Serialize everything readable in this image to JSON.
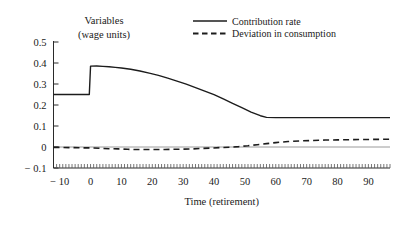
{
  "chart_data": {
    "type": "line",
    "title": "",
    "xlabel": "Time (retirement)",
    "ylabel": "Variables",
    "ylabel_line2": "(wage units)",
    "xlim": [
      -12,
      97
    ],
    "ylim": [
      -0.1,
      0.5
    ],
    "grid": false,
    "legend_position": "top-right",
    "xticks": [
      -10,
      0,
      10,
      20,
      30,
      40,
      50,
      60,
      70,
      80,
      90
    ],
    "xtick_labels": [
      "− 10",
      "0",
      "10",
      "20",
      "30",
      "40",
      "50",
      "60",
      "70",
      "80",
      "90"
    ],
    "yticks": [
      -0.1,
      0,
      0.1,
      0.2,
      0.3,
      0.4,
      0.5
    ],
    "ytick_labels": [
      "− 0.1",
      "0",
      "0.1",
      "0.2",
      "0.3",
      "0.4",
      "0.5"
    ],
    "zero_reference_line": 0,
    "series": [
      {
        "name": "Contribution rate",
        "style": "solid",
        "color": "#1c1c1c",
        "x": [
          -12,
          -10,
          -5,
          -0.4,
          0,
          2,
          4,
          6,
          8,
          10,
          13,
          16,
          19,
          22,
          25,
          28,
          31,
          34,
          37,
          40,
          43,
          46,
          49,
          52,
          55,
          57,
          60,
          65,
          70,
          75,
          80,
          85,
          90,
          97
        ],
        "values": [
          0.25,
          0.25,
          0.25,
          0.25,
          0.385,
          0.386,
          0.384,
          0.382,
          0.379,
          0.376,
          0.37,
          0.362,
          0.352,
          0.341,
          0.328,
          0.314,
          0.299,
          0.283,
          0.266,
          0.249,
          0.229,
          0.208,
          0.187,
          0.166,
          0.149,
          0.141,
          0.14,
          0.14,
          0.14,
          0.14,
          0.14,
          0.14,
          0.14,
          0.14
        ]
      },
      {
        "name": "Deviation in consumption",
        "style": "dashed",
        "color": "#1c1c1c",
        "x": [
          -12,
          -10,
          -6,
          -2,
          0,
          3,
          6,
          9,
          12,
          15,
          18,
          21,
          24,
          27,
          30,
          33,
          36,
          39,
          42,
          45,
          48,
          51,
          54,
          57,
          60,
          64,
          68,
          72,
          76,
          80,
          85,
          90,
          97
        ],
        "values": [
          -0.002,
          -0.002,
          -0.003,
          -0.004,
          -0.004,
          -0.006,
          -0.008,
          -0.009,
          -0.011,
          -0.012,
          -0.012,
          -0.012,
          -0.012,
          -0.011,
          -0.01,
          -0.009,
          -0.007,
          -0.005,
          -0.003,
          -0.001,
          0.002,
          0.006,
          0.011,
          0.016,
          0.021,
          0.026,
          0.029,
          0.031,
          0.033,
          0.034,
          0.035,
          0.036,
          0.037
        ]
      }
    ]
  },
  "legend": {
    "entries": [
      {
        "label": "Contribution rate",
        "style": "solid"
      },
      {
        "label": "Deviation in consumption",
        "style": "dashed"
      }
    ]
  }
}
